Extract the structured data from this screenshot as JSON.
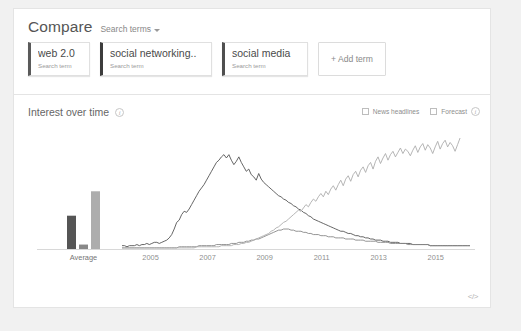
{
  "header": {
    "title": "Compare",
    "dropdown_label": "Search terms",
    "caret_icon": "chevron-down-icon"
  },
  "terms": [
    {
      "name": "web 2.0",
      "subtitle": "Search term",
      "color": "#5a5a5a"
    },
    {
      "name": "social networking..",
      "subtitle": "Search term",
      "color": "#3c3c3c"
    },
    {
      "name": "social media",
      "subtitle": "Search term",
      "color": "#4f4f4f"
    }
  ],
  "add_term": {
    "label": "+ Add term"
  },
  "interest": {
    "title": "Interest over time",
    "info_icon": "info-icon",
    "info_glyph": "i",
    "controls": [
      {
        "label": "News headlines",
        "checked": false
      },
      {
        "label": "Forecast",
        "checked": false
      }
    ],
    "forecast_info_glyph": "i",
    "embed_icon": "code-embed-icon",
    "embed_glyph": "</>"
  },
  "chart_data": {
    "type": "line",
    "title": "Interest over time",
    "xlabel": "",
    "ylabel": "",
    "ylim": [
      0,
      100
    ],
    "grid": false,
    "legend": "none",
    "average_group_label": "Average",
    "average_values": [
      30,
      4,
      52
    ],
    "x_tick_labels": [
      "2005",
      "2007",
      "2009",
      "2011",
      "2013",
      "2015"
    ],
    "x_tick_values": [
      2005,
      2007,
      2009,
      2011,
      2013,
      2015
    ],
    "x_range": [
      2004,
      2016.2
    ],
    "series": [
      {
        "name": "web 2.0",
        "color": "#555555",
        "values": [
          3,
          3,
          2,
          3,
          3,
          3,
          4,
          3,
          4,
          4,
          5,
          4,
          5,
          6,
          6,
          5,
          6,
          7,
          8,
          10,
          13,
          18,
          24,
          26,
          31,
          34,
          33,
          36,
          40,
          44,
          48,
          52,
          55,
          58,
          62,
          66,
          70,
          74,
          78,
          80,
          83,
          85,
          82,
          85,
          80,
          76,
          79,
          83,
          78,
          74,
          70,
          72,
          67,
          65,
          62,
          68,
          63,
          60,
          58,
          56,
          54,
          52,
          50,
          48,
          47,
          45,
          44,
          42,
          41,
          39,
          38,
          36,
          35,
          33,
          32,
          30,
          29,
          27,
          26,
          25,
          24,
          23,
          22,
          21,
          20,
          19,
          18,
          17,
          16,
          16,
          15,
          14,
          14,
          13,
          12,
          12,
          11,
          11,
          10,
          10,
          9,
          9,
          8,
          8,
          8,
          7,
          7,
          7,
          6,
          6,
          6,
          6,
          5,
          5,
          5,
          5,
          5,
          4,
          4,
          4,
          4,
          4,
          4,
          4,
          3,
          3,
          3,
          3,
          3,
          3,
          3,
          3,
          3,
          3,
          3,
          3,
          3,
          3,
          3,
          3,
          3
        ]
      },
      {
        "name": "social networking..",
        "color": "#888888",
        "values": [
          1,
          1,
          1,
          1,
          1,
          1,
          1,
          1,
          1,
          1,
          1,
          1,
          1,
          1,
          1,
          1,
          1,
          1,
          1,
          1,
          1,
          1,
          1,
          2,
          2,
          2,
          2,
          2,
          2,
          2,
          2,
          3,
          3,
          3,
          3,
          3,
          3,
          3,
          4,
          4,
          4,
          4,
          4,
          4,
          5,
          5,
          5,
          6,
          6,
          6,
          7,
          7,
          8,
          8,
          9,
          9,
          10,
          11,
          12,
          13,
          14,
          15,
          16,
          17,
          17,
          18,
          18,
          18,
          17,
          17,
          16,
          16,
          16,
          15,
          15,
          14,
          14,
          13,
          13,
          13,
          12,
          12,
          12,
          11,
          11,
          11,
          10,
          10,
          10,
          10,
          9,
          9,
          9,
          9,
          8,
          8,
          8,
          8,
          7,
          7,
          7,
          7,
          7,
          6,
          6,
          6,
          6,
          6,
          5,
          5,
          5,
          5,
          5,
          5,
          5,
          4,
          4,
          4,
          4,
          4,
          4,
          4,
          4,
          4,
          3,
          3,
          3,
          3,
          3,
          3,
          3,
          3,
          3,
          3,
          3,
          3,
          3,
          3,
          3,
          3,
          3
        ]
      },
      {
        "name": "social media",
        "color": "#adadad",
        "values": [
          1,
          1,
          1,
          1,
          1,
          1,
          1,
          1,
          1,
          1,
          1,
          1,
          1,
          1,
          1,
          1,
          1,
          1,
          1,
          1,
          1,
          1,
          1,
          1,
          1,
          1,
          1,
          1,
          1,
          1,
          2,
          2,
          2,
          2,
          2,
          2,
          2,
          2,
          2,
          2,
          3,
          3,
          3,
          3,
          3,
          4,
          4,
          4,
          5,
          5,
          6,
          6,
          7,
          8,
          9,
          10,
          11,
          12,
          13,
          14,
          16,
          17,
          19,
          20,
          22,
          24,
          25,
          27,
          29,
          31,
          33,
          35,
          34,
          37,
          40,
          38,
          42,
          45,
          43,
          47,
          50,
          47,
          52,
          49,
          54,
          57,
          53,
          58,
          62,
          57,
          63,
          66,
          61,
          67,
          70,
          65,
          71,
          74,
          69,
          75,
          78,
          72,
          79,
          83,
          77,
          82,
          86,
          80,
          85,
          88,
          83,
          87,
          91,
          86,
          90,
          88,
          84,
          89,
          93,
          87,
          92,
          95,
          89,
          94,
          91,
          86,
          92,
          97,
          90,
          95,
          98,
          92,
          96,
          93,
          88,
          94,
          100
        ]
      }
    ]
  }
}
